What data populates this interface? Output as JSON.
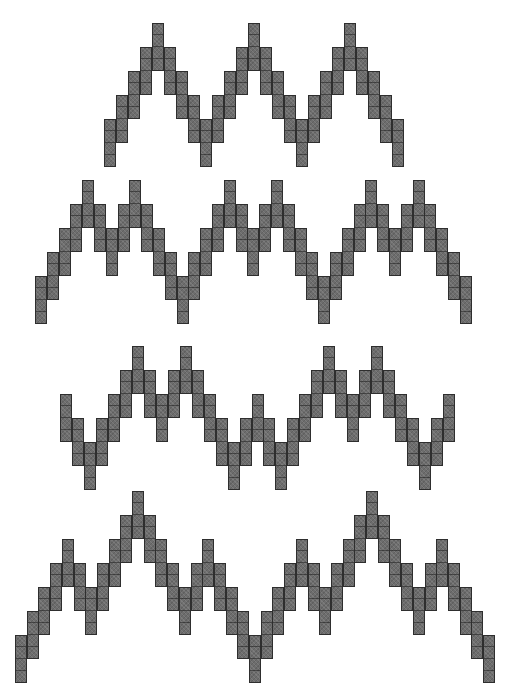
{
  "colors": {
    "stitch_fill": "#6d6d6d",
    "stitch_outline": "#2e2e2e",
    "background": "#ffffff"
  },
  "cell": {
    "width": 12,
    "height": 12,
    "cells_per_column": 4,
    "level_step": 24
  },
  "rows": [
    {
      "name": "pattern-row-1",
      "x_start": 104,
      "pitch": 12,
      "top_y": 23,
      "levels": [
        4,
        3,
        2,
        1,
        0,
        1,
        2,
        3,
        4,
        3,
        2,
        1,
        0,
        1,
        2,
        3,
        4,
        3,
        2,
        1,
        0,
        1,
        2,
        3,
        4
      ]
    },
    {
      "name": "pattern-row-2",
      "x_start": 35,
      "pitch": 11.8,
      "top_y": 180,
      "levels": [
        4,
        3,
        2,
        1,
        0,
        1,
        2,
        1,
        0,
        1,
        2,
        3,
        4,
        3,
        2,
        1,
        0,
        1,
        2,
        1,
        0,
        1,
        2,
        3,
        4,
        3,
        2,
        1,
        0,
        1,
        2,
        1,
        0,
        1,
        2,
        3,
        4
      ]
    },
    {
      "name": "pattern-row-3",
      "x_start": 60,
      "pitch": 11.97,
      "top_y": 346,
      "levels": [
        2,
        3,
        4,
        3,
        2,
        1,
        0,
        1,
        2,
        1,
        0,
        1,
        2,
        3,
        4,
        3,
        2,
        3,
        4,
        3,
        2,
        1,
        0,
        1,
        2,
        1,
        0,
        1,
        2,
        3,
        4,
        3,
        2
      ]
    },
    {
      "name": "pattern-row-4",
      "x_start": 15,
      "pitch": 11.7,
      "top_y": 491,
      "levels": [
        6,
        5,
        4,
        3,
        2,
        3,
        4,
        3,
        2,
        1,
        0,
        1,
        2,
        3,
        4,
        3,
        2,
        3,
        4,
        5,
        6,
        5,
        4,
        3,
        2,
        3,
        4,
        3,
        2,
        1,
        0,
        1,
        2,
        3,
        4,
        3,
        2,
        3,
        4,
        5,
        6
      ]
    }
  ]
}
